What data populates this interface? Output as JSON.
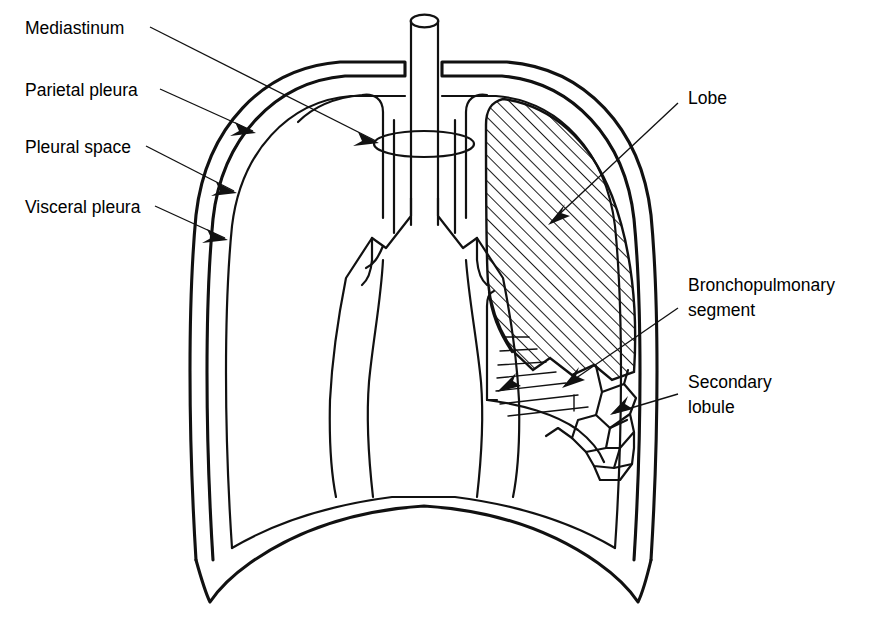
{
  "figure": {
    "background_color": "#ffffff",
    "ink_color": "#111111",
    "width": 876,
    "height": 624
  },
  "labels": {
    "mediastinum": "Mediastinum",
    "parietal_pleura": "Parietal pleura",
    "pleural_space": "Pleural space",
    "visceral_pleura": "Visceral pleura",
    "lobe": "Lobe",
    "bronchopulmonary_segment_line1": "Bronchopulmonary",
    "bronchopulmonary_segment_line2": "segment",
    "secondary_lobule_line1": "Secondary",
    "secondary_lobule_line2": "lobule"
  },
  "label_positions": {
    "mediastinum": {
      "x": 25,
      "y": 29
    },
    "parietal_pleura": {
      "x": 25,
      "y": 91
    },
    "pleural_space": {
      "x": 25,
      "y": 148
    },
    "visceral_pleura": {
      "x": 25,
      "y": 208
    },
    "lobe": {
      "x": 688,
      "y": 99
    },
    "bronchopulmonary_segment_line1": {
      "x": 688,
      "y": 286
    },
    "bronchopulmonary_segment_line2": {
      "x": 688,
      "y": 311
    },
    "secondary_lobule_line1": {
      "x": 688,
      "y": 383
    },
    "secondary_lobule_line2": {
      "x": 688,
      "y": 408
    }
  },
  "structures": [
    {
      "name": "trachea",
      "description": "vertical tube with elliptical top opening, center of image"
    },
    {
      "name": "mediastinum-ring",
      "description": "ellipse encircling the trachea marking the mediastinum"
    },
    {
      "name": "main-bronchi",
      "description": "Y-shaped bifurcation below the trachea"
    },
    {
      "name": "chest-wall-outer",
      "description": "outer thoracic cage outline, parietal pleura"
    },
    {
      "name": "chest-wall-inner",
      "description": "inner lung surface outline, visceral pleura"
    },
    {
      "name": "pleural-space",
      "description": "gap between parietal and visceral pleura"
    },
    {
      "name": "diaphragm",
      "description": "domed curve at the base of the thorax"
    },
    {
      "name": "lobe-hatched",
      "description": "cross-hatched upper lobe of the right lung"
    },
    {
      "name": "bronchopulmonary-segment",
      "description": "wedge region marked with short horizontal rules"
    },
    {
      "name": "secondary-lobules",
      "description": "cluster of small polygonal cells"
    }
  ],
  "leaders": [
    {
      "name": "mediastinum-leader",
      "from": [
        150,
        27
      ],
      "to": [
        376,
        141
      ]
    },
    {
      "name": "parietal-pleura-leader",
      "from": [
        160,
        89
      ],
      "to": [
        252,
        131
      ]
    },
    {
      "name": "pleural-space-leader",
      "from": [
        146,
        146
      ],
      "to": [
        233,
        191
      ]
    },
    {
      "name": "visceral-pleura-leader",
      "from": [
        155,
        206
      ],
      "to": [
        224,
        237
      ]
    },
    {
      "name": "lobe-leader",
      "from": [
        678,
        103
      ],
      "to": [
        549,
        223
      ]
    },
    {
      "name": "bronchopulmonary-segment-leader",
      "from": [
        678,
        311
      ],
      "to": [
        563,
        386
      ]
    },
    {
      "name": "secondary-lobule-leader",
      "from": [
        678,
        396
      ],
      "to": [
        612,
        414
      ]
    }
  ]
}
